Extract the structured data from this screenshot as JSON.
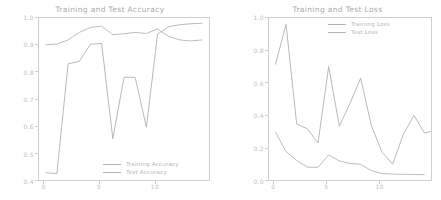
{
  "figure": {
    "background": "#ffffff",
    "axis_color": "#cfcfcf",
    "tick_label_color": "#c0c0c0"
  },
  "chart_data": [
    {
      "type": "line",
      "title": "Training and Test Accuracy",
      "xlabel": "",
      "ylabel": "",
      "xlim": [
        -0.6,
        14.6
      ],
      "ylim": [
        0.37,
        1.02
      ],
      "grid": false,
      "legend_position": "lower right",
      "xticks": [
        0,
        5,
        10
      ],
      "yticks": [
        0.4,
        0.5,
        0.6,
        0.7,
        0.8,
        0.9,
        1.0
      ],
      "ytick_labels": [
        "0.4",
        "0.5",
        "0.6",
        "0.7",
        "0.8",
        "0.9",
        "1.0"
      ],
      "xtick_labels": [
        "0",
        "5",
        "10"
      ],
      "x": [
        0,
        1,
        2,
        3,
        4,
        5,
        6,
        7,
        8,
        9,
        10,
        11,
        12,
        13,
        14
      ],
      "series": [
        {
          "name": "Training Accuracy",
          "color": "#b0aeb8",
          "values": [
            0.399,
            0.396,
            0.836,
            0.846,
            0.915,
            0.918,
            0.536,
            0.782,
            0.782,
            0.582,
            0.955,
            0.985,
            0.993,
            0.997,
            0.999
          ]
        },
        {
          "name": "Test Accuracy",
          "color": "#b8b2bc",
          "values": [
            0.913,
            0.915,
            0.932,
            0.962,
            0.982,
            0.987,
            0.953,
            0.957,
            0.962,
            0.958,
            0.976,
            0.946,
            0.932,
            0.928,
            0.932
          ]
        }
      ]
    },
    {
      "type": "line",
      "title": "Training and Test Loss",
      "xlabel": "",
      "ylabel": "",
      "xlim": [
        -0.6,
        14.6
      ],
      "ylim": [
        -0.03,
        1.03
      ],
      "grid": false,
      "legend_position": "upper right",
      "xticks": [
        0,
        5,
        10
      ],
      "yticks": [
        0.0,
        0.2,
        0.4,
        0.6,
        0.8,
        1.0
      ],
      "ytick_labels": [
        "0.0",
        "0.2",
        "0.4",
        "0.6",
        "0.8",
        "1.0"
      ],
      "xtick_labels": [
        "0",
        "5",
        "10"
      ],
      "x": [
        0,
        1,
        2,
        3,
        4,
        5,
        6,
        7,
        8,
        9,
        10,
        11,
        12,
        13,
        14
      ],
      "series": [
        {
          "name": "Training Loss",
          "color": "#b0aeb8",
          "values": [
            0.725,
            0.988,
            0.336,
            0.305,
            0.212,
            0.712,
            0.322,
            0.472,
            0.637,
            0.327,
            0.152,
            0.074,
            0.268,
            0.393,
            0.277,
            0.296
          ]
        },
        {
          "name": "Test Loss",
          "color": "#b8b2bc",
          "values": [
            0.284,
            0.156,
            0.098,
            0.054,
            0.053,
            0.134,
            0.095,
            0.078,
            0.073,
            0.031,
            0.012,
            0.009,
            0.007,
            0.006,
            0.005
          ]
        }
      ]
    }
  ]
}
